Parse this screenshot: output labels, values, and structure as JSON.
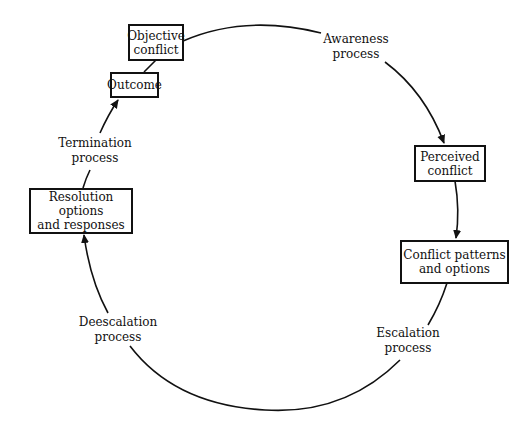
{
  "diagram": {
    "type": "cycle",
    "nodes": {
      "objective": {
        "line1": "Objective",
        "line2": "conflict"
      },
      "outcome": {
        "line1": "Outcome"
      },
      "perceived": {
        "line1": "Perceived",
        "line2": "conflict"
      },
      "patterns": {
        "line1": "Conflict patterns",
        "line2": "and options"
      },
      "resolution": {
        "line1": "Resolution options",
        "line2": "and responses"
      }
    },
    "processes": {
      "awareness": {
        "line1": "Awareness",
        "line2": "process"
      },
      "escalation": {
        "line1": "Escalation",
        "line2": "process"
      },
      "deescalation": {
        "line1": "Deescalation",
        "line2": "process"
      },
      "termination": {
        "line1": "Termination",
        "line2": "process"
      }
    },
    "edges": [
      {
        "from": "objective",
        "via": "awareness",
        "to": "perceived"
      },
      {
        "from": "perceived",
        "to": "patterns"
      },
      {
        "from": "patterns",
        "via": "escalation",
        "to": "deescalation"
      },
      {
        "from": "deescalation",
        "to": "resolution"
      },
      {
        "from": "resolution",
        "via": "termination",
        "to": "outcome"
      },
      {
        "from": "outcome",
        "to": "objective"
      }
    ],
    "colors": {
      "line": "#111111",
      "background": "#ffffff"
    }
  }
}
